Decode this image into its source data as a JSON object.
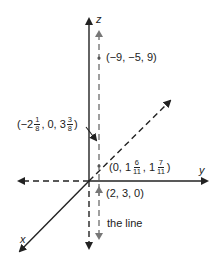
{
  "diagram": {
    "type": "3d-coordinate-axes",
    "axes": {
      "x_label": "x",
      "y_label": "y",
      "z_label": "z"
    },
    "points": [
      {
        "id": "p1",
        "label_parts": [
          "(−9, −5, 9)"
        ]
      },
      {
        "id": "p2",
        "prefix": "(−2",
        "f1_num": "1",
        "f1_den": "8",
        "mid": ", 0, 3",
        "f2_num": "3",
        "f2_den": "8",
        "suffix": ")"
      },
      {
        "id": "p3",
        "prefix": "(0, 1",
        "f1_num": "6",
        "f1_den": "11",
        "mid": ", 1",
        "f2_num": "7",
        "f2_den": "11",
        "suffix": ")"
      },
      {
        "id": "p4",
        "label_parts": [
          "(2, 3, 0)"
        ]
      }
    ],
    "line_label": "the line",
    "colors": {
      "ink": "#222222",
      "arrow_line": "#777777",
      "background": "#ffffff"
    }
  }
}
